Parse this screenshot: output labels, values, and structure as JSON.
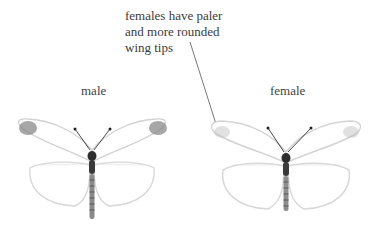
{
  "annotation": {
    "lines": [
      "females have paler",
      "and more rounded",
      "wing tips"
    ],
    "leader_color": "#555555"
  },
  "specimens": [
    {
      "label": "male",
      "wing_color": "#ffffff",
      "outline_color": "#d8d8d8",
      "tip_marking": "dark-gray"
    },
    {
      "label": "female",
      "wing_color": "#ffffff",
      "outline_color": "#d8d8d8",
      "tip_marking": "pale-gray"
    }
  ]
}
